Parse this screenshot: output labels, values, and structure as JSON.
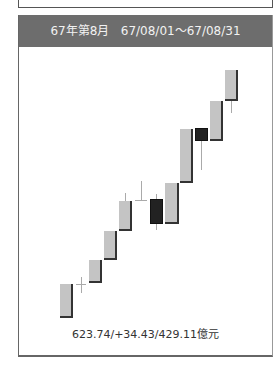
{
  "header": {
    "title": "67年第8月",
    "range": "67/08/01～67/08/31"
  },
  "summary": "623.74/+34.43/429.11億元",
  "colors": {
    "header_bg": "#6d6d6d",
    "up_body": "#c4c4c4",
    "down_body": "#222222"
  },
  "chart_data": {
    "type": "candlestick",
    "title": "67年第8月 67/08/01～67/08/31",
    "xlabel": "",
    "ylabel": "",
    "grid": false,
    "legend": "none",
    "annotation": "623.74/+34.43/429.11億元",
    "note": "Values estimated from pixel positions; no axis shown. Relative units (higher = up).",
    "candles": [
      {
        "i": 1,
        "open": 589.3,
        "close": 597.5,
        "high": 597.5,
        "low": 589.3,
        "type": "up"
      },
      {
        "i": 2,
        "open": 597.5,
        "close": 597.5,
        "high": 599.2,
        "low": 595.6,
        "type": "doji"
      },
      {
        "i": 3,
        "open": 597.8,
        "close": 603.3,
        "high": 603.3,
        "low": 597.8,
        "type": "up"
      },
      {
        "i": 4,
        "open": 603.3,
        "close": 610.3,
        "high": 610.3,
        "low": 603.3,
        "type": "up"
      },
      {
        "i": 5,
        "open": 610.3,
        "close": 617.5,
        "high": 619.4,
        "low": 610.3,
        "type": "up"
      },
      {
        "i": 6,
        "open": 617.7,
        "close": 617.7,
        "high": 622.3,
        "low": 617.7,
        "type": "doji"
      },
      {
        "i": 7,
        "open": 617.9,
        "close": 611.9,
        "high": 619.2,
        "low": 610.5,
        "type": "down"
      },
      {
        "i": 8,
        "open": 611.9,
        "close": 621.8,
        "high": 621.8,
        "low": 611.9,
        "type": "up"
      },
      {
        "i": 9,
        "open": 622.0,
        "close": 634.7,
        "high": 634.7,
        "low": 622.0,
        "type": "up"
      },
      {
        "i": 10,
        "open": 635.0,
        "close": 631.9,
        "high": 635.0,
        "low": 624.9,
        "type": "down"
      },
      {
        "i": 11,
        "open": 631.9,
        "close": 641.4,
        "high": 641.4,
        "low": 631.9,
        "type": "up"
      },
      {
        "i": 12,
        "open": 641.4,
        "close": 648.8,
        "high": 648.8,
        "low": 638.5,
        "type": "up"
      }
    ]
  },
  "candles_px": [
    {
      "x": 60,
      "w": 13,
      "top": 284,
      "bot": 318,
      "wt": 284,
      "wb": 318,
      "kind": "up"
    },
    {
      "x": 76,
      "w": 10,
      "top": 284,
      "bot": 284,
      "wt": 277,
      "wb": 293,
      "kind": "doji"
    },
    {
      "x": 89,
      "w": 13,
      "top": 260,
      "bot": 283,
      "wt": 260,
      "wb": 283,
      "kind": "up"
    },
    {
      "x": 104,
      "w": 13,
      "top": 231,
      "bot": 260,
      "wt": 231,
      "wb": 260,
      "kind": "up"
    },
    {
      "x": 119,
      "w": 13,
      "top": 201,
      "bot": 231,
      "wt": 193,
      "wb": 231,
      "kind": "up"
    },
    {
      "x": 135,
      "w": 12,
      "top": 200,
      "bot": 200,
      "wt": 181,
      "wb": 200,
      "kind": "doji"
    },
    {
      "x": 150,
      "w": 13,
      "top": 199,
      "bot": 224,
      "wt": 194,
      "wb": 230,
      "kind": "down"
    },
    {
      "x": 165,
      "w": 14,
      "top": 183,
      "bot": 224,
      "wt": 183,
      "wb": 224,
      "kind": "up"
    },
    {
      "x": 180,
      "w": 13,
      "top": 129,
      "bot": 183,
      "wt": 129,
      "wb": 183,
      "kind": "up"
    },
    {
      "x": 195,
      "w": 13,
      "top": 128,
      "bot": 141,
      "wt": 128,
      "wb": 170,
      "kind": "down"
    },
    {
      "x": 210,
      "w": 13,
      "top": 101,
      "bot": 141,
      "wt": 101,
      "wb": 141,
      "kind": "up"
    },
    {
      "x": 225,
      "w": 13,
      "top": 70,
      "bot": 101,
      "wt": 70,
      "wb": 113,
      "kind": "up"
    }
  ]
}
